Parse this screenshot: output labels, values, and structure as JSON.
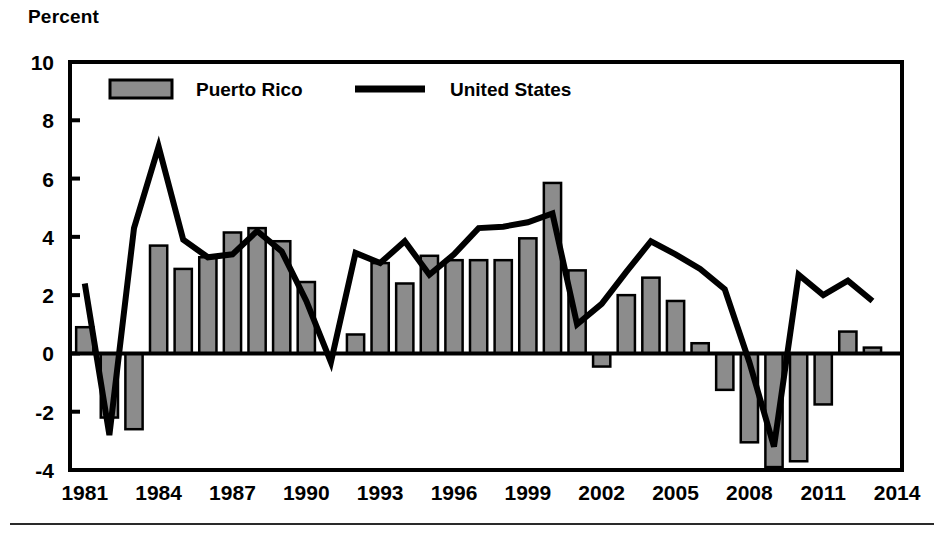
{
  "chart_data": {
    "type": "bar",
    "title": "",
    "ylabel": "Percent",
    "xlabel": "",
    "ylim": [
      -4,
      10
    ],
    "yticks": [
      10,
      8,
      6,
      4,
      2,
      0,
      -2,
      -4
    ],
    "ytick_labels": [
      "10",
      "8",
      "6",
      "4",
      "2",
      "0",
      "-2",
      "-4"
    ],
    "xlim": [
      1980.4,
      2014.2
    ],
    "xticks": [
      1981,
      1984,
      1987,
      1990,
      1993,
      1996,
      1999,
      2002,
      2005,
      2008,
      2011,
      2014
    ],
    "xtick_labels": [
      "1981",
      "1984",
      "1987",
      "1990",
      "1993",
      "1996",
      "1999",
      "2002",
      "2005",
      "2008",
      "2011",
      "2014"
    ],
    "grid": false,
    "legend_position": "top-left-inside",
    "categories": [
      1981,
      1982,
      1983,
      1984,
      1985,
      1986,
      1987,
      1988,
      1989,
      1990,
      1991,
      1992,
      1993,
      1994,
      1995,
      1996,
      1997,
      1998,
      1999,
      2000,
      2001,
      2002,
      2003,
      2004,
      2005,
      2006,
      2007,
      2008,
      2009,
      2010,
      2011,
      2012,
      2013
    ],
    "series": [
      {
        "name": "Puerto Rico",
        "type": "bar",
        "color": "#8c8c8c",
        "edge_color": "#000000",
        "values": [
          0.9,
          -2.2,
          -2.6,
          3.7,
          2.9,
          3.3,
          4.15,
          4.3,
          3.85,
          2.45,
          0.0,
          0.65,
          3.1,
          2.4,
          3.35,
          3.2,
          3.2,
          3.2,
          3.95,
          5.85,
          2.85,
          -0.45,
          2.0,
          2.6,
          1.8,
          0.35,
          -1.25,
          -3.05,
          -3.9,
          -3.7,
          -1.75,
          0.75,
          0.2
        ]
      },
      {
        "name": "United States",
        "type": "line",
        "color": "#000000",
        "values": [
          2.4,
          -2.8,
          4.3,
          7.1,
          3.9,
          3.3,
          3.4,
          4.2,
          3.5,
          1.8,
          -0.3,
          3.45,
          3.1,
          3.85,
          2.7,
          3.4,
          4.3,
          4.35,
          4.5,
          4.8,
          1.0,
          1.7,
          2.8,
          3.85,
          3.4,
          2.9,
          2.2,
          -0.3,
          -3.2,
          2.7,
          2.0,
          2.5,
          1.8
        ]
      }
    ]
  },
  "legend": {
    "items": [
      {
        "label": "Puerto Rico",
        "marker": "bar-swatch"
      },
      {
        "label": "United States",
        "marker": "line-swatch"
      }
    ]
  },
  "colors": {
    "bar_fill": "#8c8c8c",
    "bar_edge": "#000000",
    "line": "#000000",
    "axis": "#000000",
    "background": "#ffffff"
  }
}
